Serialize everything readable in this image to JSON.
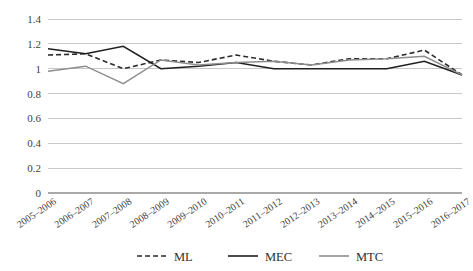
{
  "chart_data": {
    "type": "line",
    "title": "",
    "subtitle": "",
    "xlabel": "",
    "ylabel": "",
    "ylim": [
      0,
      1.4
    ],
    "yticks": [
      0,
      0.2,
      0.4,
      0.6,
      0.8,
      1,
      1.2,
      1.4
    ],
    "ytick_labels": [
      "0",
      "0.2",
      "0.4",
      "0.6",
      "0.8",
      "1",
      "1.2",
      "1.4"
    ],
    "grid": true,
    "legend_position": "bottom",
    "categories": [
      "2005–2006",
      "2006–2007",
      "2007–2008",
      "2008–2009",
      "2009–2010",
      "2010–2011",
      "2011–2012",
      "2012–2013",
      "2013–2014",
      "2014–2015",
      "2015–2016",
      "2016–2017"
    ],
    "series": [
      {
        "name": "ML",
        "style": "dashed",
        "color": "#2b2b2b",
        "width": 1.6,
        "values": [
          1.11,
          1.12,
          1.0,
          1.07,
          1.05,
          1.11,
          1.06,
          1.03,
          1.08,
          1.08,
          1.15,
          0.95
        ]
      },
      {
        "name": "MEC",
        "style": "solid",
        "color": "#1f1f1f",
        "width": 1.6,
        "values": [
          1.16,
          1.12,
          1.18,
          1.0,
          1.02,
          1.05,
          1.0,
          1.0,
          1.0,
          1.0,
          1.06,
          0.95
        ]
      },
      {
        "name": "MTC",
        "style": "solid",
        "color": "#8d8d8d",
        "width": 1.4,
        "values": [
          0.98,
          1.02,
          0.88,
          1.07,
          1.03,
          1.05,
          1.06,
          1.03,
          1.07,
          1.08,
          1.1,
          0.95
        ]
      }
    ],
    "legend": [
      {
        "label": "ML",
        "style": "dashed",
        "color": "#2b2b2b"
      },
      {
        "label": "MEC",
        "style": "solid",
        "color": "#1f1f1f"
      },
      {
        "label": "MTC",
        "style": "solid",
        "color": "#8d8d8d"
      }
    ]
  },
  "geometry": {
    "plot_left": 48,
    "plot_right": 462,
    "plot_top": 19,
    "plot_bottom": 193
  }
}
